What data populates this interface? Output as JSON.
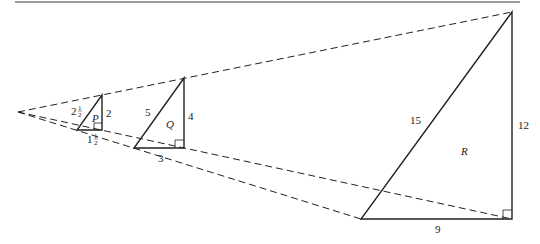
{
  "figure": {
    "rule_color": "#7a7a7a",
    "line_color": "#222222",
    "apex": [
      18,
      112
    ],
    "triangles": [
      {
        "name": "P",
        "label": "P",
        "vertices": {
          "top": [
            102,
            95
          ],
          "bottom_left": [
            77,
            130
          ],
          "bottom_right": [
            102,
            130
          ]
        },
        "hypotenuse": {
          "whole": "2",
          "num": "1",
          "den": "2"
        },
        "vertical_leg": "2",
        "horizontal_leg": {
          "whole": "1",
          "num": "1",
          "den": "2"
        }
      },
      {
        "name": "Q",
        "label": "Q",
        "vertices": {
          "top": [
            184,
            78
          ],
          "bottom_left": [
            134,
            148
          ],
          "bottom_right": [
            184,
            148
          ]
        },
        "hypotenuse": "5",
        "vertical_leg": "4",
        "horizontal_leg": "3"
      },
      {
        "name": "R",
        "label": "R",
        "vertices": {
          "top": [
            512,
            12
          ],
          "bottom_left": [
            361,
            219
          ],
          "bottom_right": [
            512,
            219
          ]
        },
        "hypotenuse": "15",
        "vertical_leg": "12",
        "horizontal_leg": "9"
      }
    ]
  }
}
